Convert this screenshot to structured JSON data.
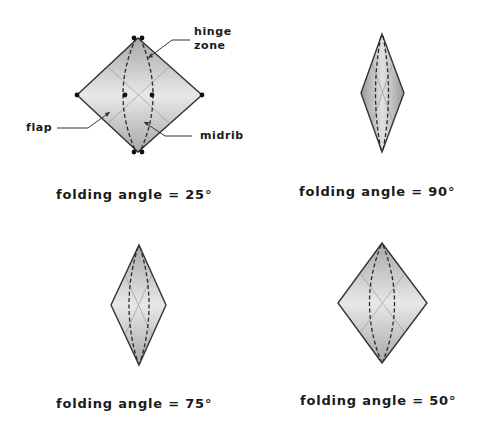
{
  "annotations": {
    "hinge_line1": "hinge",
    "hinge_line2": "zone",
    "flap": "flap",
    "midrib": "midrib"
  },
  "panels": [
    {
      "caption": "folding angle = 25°",
      "angle": 25
    },
    {
      "caption": "folding angle = 90°",
      "angle": 90
    },
    {
      "caption": "folding angle = 75°",
      "angle": 75
    },
    {
      "caption": "folding angle = 50°",
      "angle": 50
    }
  ],
  "colors": {
    "fill_light": "#e4e4e4",
    "fill_dark": "#a8a8a8",
    "outline": "#333333"
  }
}
